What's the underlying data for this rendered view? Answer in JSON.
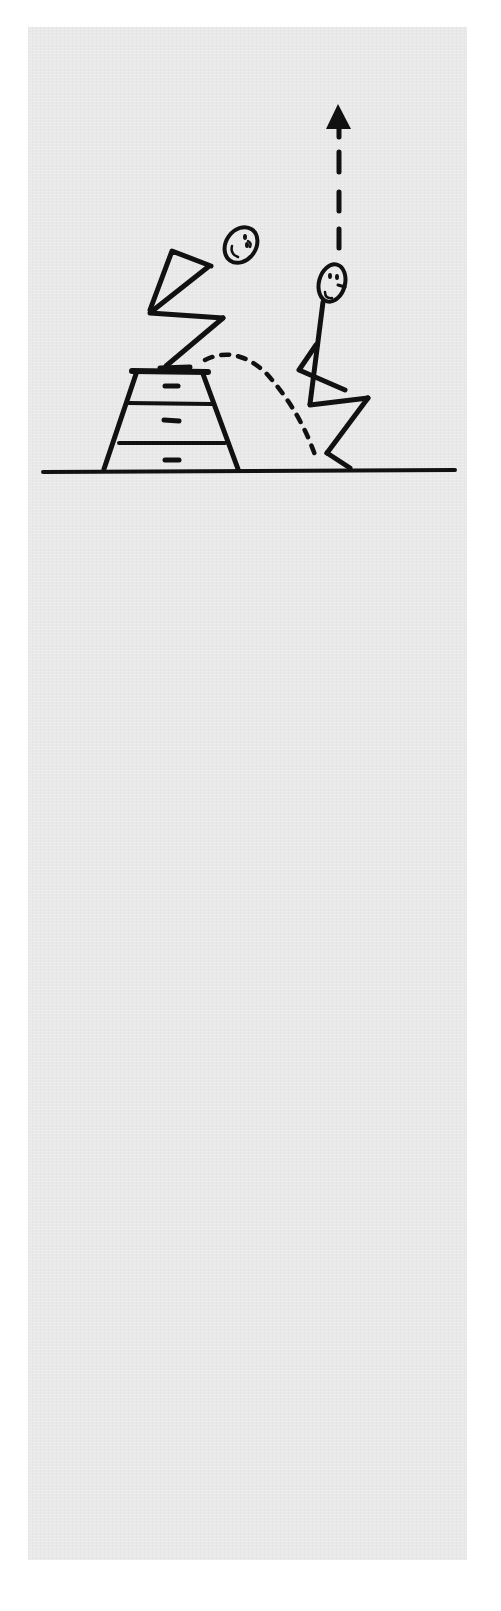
{
  "figure": {
    "background_color": "#e9e9e9",
    "ink_color": "#111111",
    "elements": [
      {
        "id": "jumper-on-box",
        "pose": "crouched, arms back, ready to jump"
      },
      {
        "id": "plyo-box",
        "sections": 3
      },
      {
        "id": "trajectory-arc",
        "style": "dashed",
        "direction": "from box top down to floor"
      },
      {
        "id": "jumper-landing",
        "pose": "squat landing"
      },
      {
        "id": "rebound-arrow",
        "style": "dashed",
        "direction": "up"
      },
      {
        "id": "ground-line"
      }
    ]
  }
}
